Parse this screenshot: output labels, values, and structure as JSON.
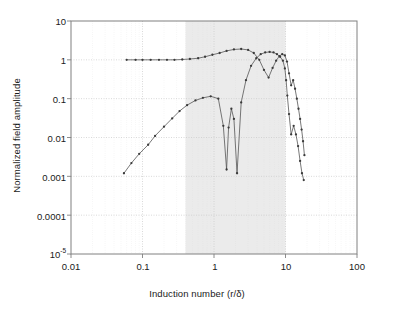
{
  "chart_data": {
    "type": "line",
    "title": "",
    "xlabel": "Induction number (r/δ)",
    "ylabel": "Normalized field amplitude",
    "xscale": "log",
    "yscale": "log",
    "xlim": [
      0.01,
      100
    ],
    "ylim": [
      1e-05,
      10
    ],
    "grid": true,
    "legend": "none",
    "xticks": [
      "0.01",
      "0.1",
      "1",
      "10",
      "100"
    ],
    "xtick_values": [
      0.01,
      0.1,
      1,
      10,
      100
    ],
    "yticks": [
      "10",
      "1",
      "0.1",
      "0.01",
      "0.001",
      "0.0001",
      "10⁻⁵"
    ],
    "ytick_values": [
      10,
      1,
      0.1,
      0.01,
      0.001,
      0.0001,
      1e-05
    ],
    "shaded_band": {
      "label": "",
      "x_start": 0.4,
      "x_end": 10,
      "color": "#ebebeb"
    },
    "marker": "dot",
    "line_color": "#555555",
    "series": [
      {
        "name": "in-phase component",
        "marker": "dot",
        "x": [
          0.06,
          0.08,
          0.1,
          0.13,
          0.17,
          0.22,
          0.28,
          0.36,
          0.46,
          0.6,
          0.75,
          0.95,
          1.2,
          1.5,
          1.9,
          2.4,
          3.0,
          3.6,
          4.3,
          5.0,
          5.8,
          6.6,
          7.4,
          8.2,
          9.0,
          9.8,
          10.5,
          11.2,
          12.0,
          12.8,
          13.6,
          14.4,
          15.2,
          16.0,
          16.8,
          17.6,
          18.4
        ],
        "y": [
          1.0,
          1.0,
          1.0,
          1.0,
          1.0,
          1.0,
          1.0,
          1.02,
          1.05,
          1.1,
          1.2,
          1.35,
          1.5,
          1.7,
          1.85,
          1.9,
          1.8,
          1.5,
          1.0,
          0.55,
          0.35,
          0.62,
          0.95,
          1.25,
          1.4,
          1.3,
          0.9,
          0.45,
          0.22,
          0.3,
          0.18,
          0.1,
          0.055,
          0.03,
          0.016,
          0.008,
          0.0035
        ]
      },
      {
        "name": "quadrature component",
        "marker": "dot",
        "x": [
          0.055,
          0.07,
          0.09,
          0.12,
          0.15,
          0.2,
          0.26,
          0.33,
          0.42,
          0.55,
          0.7,
          0.9,
          1.15,
          1.35,
          1.5,
          1.6,
          1.75,
          1.9,
          2.1,
          2.4,
          2.8,
          3.3,
          3.9,
          4.5,
          5.2,
          6.0,
          6.8,
          7.6,
          8.4,
          9.2,
          9.8,
          10.2,
          10.6,
          11.2,
          12.0,
          13.0,
          14.0,
          15.0,
          16.0,
          17.0,
          18.0
        ],
        "y": [
          0.0012,
          0.0022,
          0.0038,
          0.0065,
          0.011,
          0.019,
          0.031,
          0.048,
          0.068,
          0.09,
          0.105,
          0.115,
          0.1,
          0.02,
          0.0015,
          0.018,
          0.055,
          0.03,
          0.0012,
          0.08,
          0.3,
          0.7,
          1.1,
          1.4,
          1.55,
          1.6,
          1.55,
          1.4,
          1.2,
          0.95,
          0.6,
          0.3,
          0.12,
          0.04,
          0.012,
          0.02,
          0.012,
          0.006,
          0.0025,
          0.0012,
          0.0008
        ]
      }
    ]
  },
  "axes": {
    "frame_color": "#808080",
    "grid_color": "#c8c8c8",
    "background": "#ffffff"
  }
}
